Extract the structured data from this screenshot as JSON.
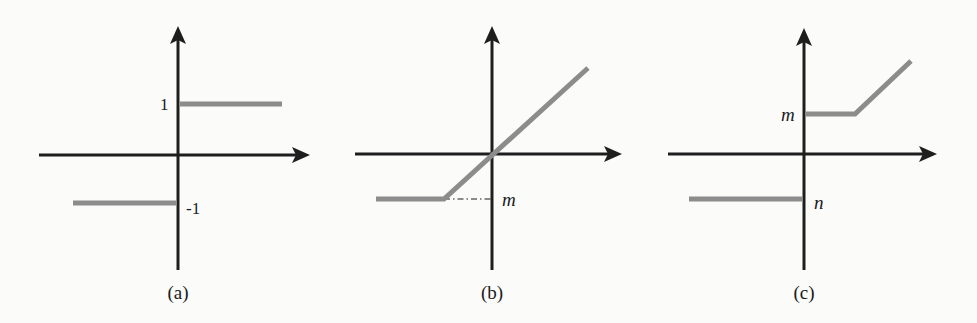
{
  "figure": {
    "colors": {
      "axis": "#1e1e1e",
      "curve": "#8c8c8c",
      "background": "#fbfbfa"
    },
    "panels": [
      {
        "id": "a",
        "caption": "(a)",
        "kind": "sign / step function",
        "labels": {
          "upper": "1",
          "lower": "-1"
        },
        "segments": [
          {
            "name": "negative-branch",
            "y_value": -1,
            "x_range": "x < 0"
          },
          {
            "name": "positive-branch",
            "y_value": 1,
            "x_range": "x > 0"
          }
        ]
      },
      {
        "id": "b",
        "caption": "(b)",
        "kind": "lower-clipped linear (ramp with floor m)",
        "labels": {
          "floor": "m"
        },
        "segments": [
          {
            "name": "floor-branch",
            "y_value": "m",
            "x_range": "x < m"
          },
          {
            "name": "identity-branch",
            "relation": "y = x",
            "x_range": "x >= m"
          }
        ],
        "guide": "dash-dot line from breakpoint to y-axis at level m"
      },
      {
        "id": "c",
        "caption": "(c)",
        "kind": "piecewise with jump: n for x<0, m then rising linear for x>0",
        "labels": {
          "upper": "m",
          "lower": "n"
        },
        "segments": [
          {
            "name": "negative-branch",
            "y_value": "n",
            "x_range": "x < 0"
          },
          {
            "name": "flat-branch",
            "y_value": "m",
            "x_range": "0 < x < m"
          },
          {
            "name": "rising-branch",
            "relation": "y = x",
            "x_range": "x >= m"
          }
        ]
      }
    ]
  }
}
